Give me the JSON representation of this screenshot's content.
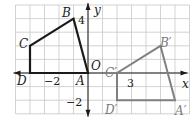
{
  "figure": {
    "grid": {
      "x_min": -5,
      "x_max": 7,
      "y_min": -3,
      "y_max": 5,
      "origin_px": [
        88,
        73
      ],
      "unit_x_px": 14.5,
      "unit_y_px": 13.6,
      "grid_color": "#c8c8c8",
      "axis_color": "#1a1a1a"
    },
    "axes": {
      "x_label": "x",
      "y_label": "y",
      "origin_label": "O",
      "tick_labels": {
        "x_neg2": "−2",
        "x_3": "3",
        "y_4": "4",
        "y_neg2": "−2"
      }
    },
    "original_shape": {
      "name": "ABCD",
      "color": "#1a1a1a",
      "vertices": [
        {
          "label": "A",
          "x": 0,
          "y": 0
        },
        {
          "label": "B",
          "x": -1,
          "y": 4
        },
        {
          "label": "C",
          "x": -4,
          "y": 2
        },
        {
          "label": "D",
          "x": -4,
          "y": 0
        }
      ]
    },
    "image_shape": {
      "name": "A'B'C'D'",
      "color": "#808080",
      "vertices": [
        {
          "label": "A′",
          "x": 6,
          "y": -2
        },
        {
          "label": "B′",
          "x": 5,
          "y": 2
        },
        {
          "label": "C′",
          "x": 2,
          "y": 0
        },
        {
          "label": "D′",
          "x": 2,
          "y": -2
        }
      ]
    }
  }
}
